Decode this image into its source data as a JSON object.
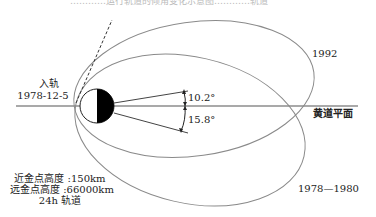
{
  "caption_fragment": "…………运行轨道的倾角变化示意图…………轨道",
  "labels": {
    "orbit_insertion_title": "入轨",
    "orbit_insertion_date": "1978-12-5",
    "orbit_1992": "1992",
    "orbit_1978_1980": "1978—1980",
    "ecliptic_plane": "黄道平面",
    "angle_upper": "10.2°",
    "angle_lower": "15.8°",
    "perigee": "近金点高度 :150km",
    "apogee": "远金点高度 :66000km",
    "period": "24h 轨道"
  },
  "colors": {
    "orbit_line": "#8a8a8a",
    "axis_line": "#555555",
    "planet_dark": "#000000",
    "text": "#222222"
  }
}
